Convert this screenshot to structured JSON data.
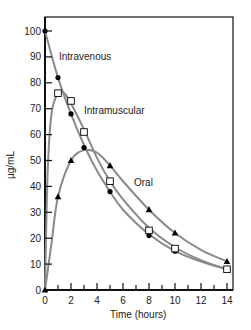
{
  "chart_data": {
    "type": "line",
    "title": "",
    "xlabel": "Time (hours)",
    "ylabel": "µg/mL",
    "xlim": [
      0,
      14
    ],
    "ylim": [
      0,
      100
    ],
    "xticks": [
      0,
      2,
      4,
      6,
      8,
      10,
      12,
      14
    ],
    "yticks": [
      0,
      10,
      20,
      30,
      40,
      50,
      60,
      70,
      80,
      90,
      100
    ],
    "grid": false,
    "legend": "inline labels",
    "series": [
      {
        "name": "Intravenous",
        "marker": "filled-circle",
        "x": [
          0,
          1,
          2,
          3,
          5,
          8,
          10,
          14
        ],
        "values": [
          100,
          82,
          68,
          55,
          38,
          21,
          15,
          8
        ]
      },
      {
        "name": "Intramuscular",
        "marker": "open-square",
        "x": [
          1,
          2,
          3,
          5,
          8,
          10,
          14
        ],
        "values": [
          76,
          73,
          61,
          42,
          23,
          16,
          8
        ]
      },
      {
        "name": "Oral",
        "marker": "filled-triangle",
        "x": [
          0,
          1,
          2,
          5,
          8,
          10,
          14
        ],
        "values": [
          0,
          36,
          50,
          48,
          31,
          22,
          11
        ]
      }
    ],
    "annotations": [
      {
        "text": "Intravenous",
        "x": 1.5,
        "y": 89
      },
      {
        "text": "Intramuscular",
        "x": 4.2,
        "y": 70
      },
      {
        "text": "Oral",
        "x": 7.2,
        "y": 49
      }
    ]
  },
  "labels": {
    "xlabel": "Time (hours)",
    "ylabel": "µg/mL",
    "intravenous": "Intravenous",
    "intramuscular": "Intramuscular",
    "oral": "Oral"
  },
  "colors": {
    "curve": "#8a8a8a",
    "axis": "#111111",
    "marker": "#000000"
  }
}
